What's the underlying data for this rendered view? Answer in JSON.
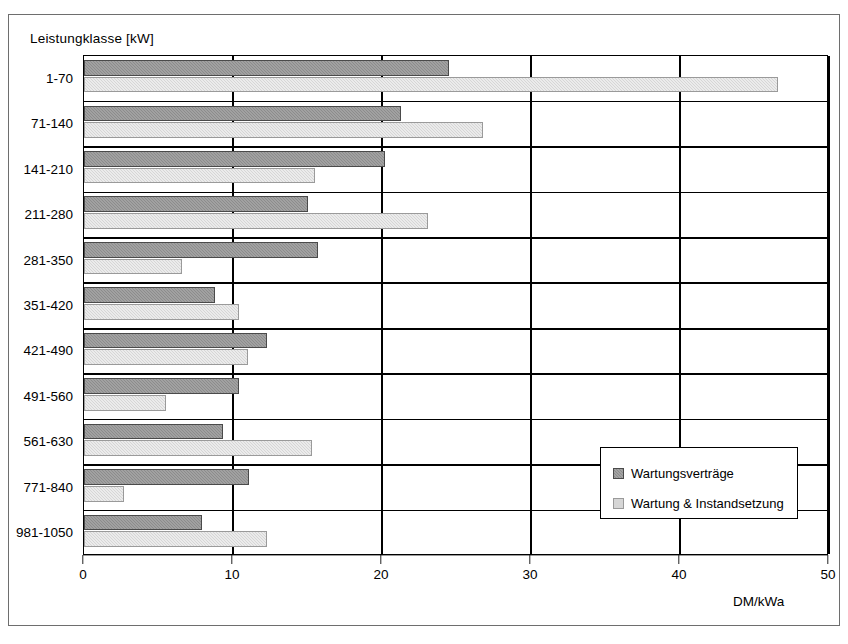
{
  "chart_data": {
    "type": "bar",
    "orientation": "horizontal",
    "title": "",
    "axis_caption": "Leistungklasse  [kW]",
    "xlabel": "DM/kWa",
    "ylabel": "Leistungklasse  [kW]",
    "xlim": [
      0,
      50
    ],
    "xticks": [
      0,
      10,
      20,
      30,
      40,
      50
    ],
    "xticklabels": [
      "0",
      "10",
      "20",
      "30",
      "40",
      "50"
    ],
    "grid": true,
    "legend_position": "lower right",
    "categories": [
      "1-70",
      "71-140",
      "141-210",
      "211-280",
      "281-350",
      "351-420",
      "421-490",
      "491-560",
      "561-630",
      "771-840",
      "981-1050"
    ],
    "series": [
      {
        "name": "Wartungsverträge",
        "color": "#8c8c8c",
        "values": [
          24.5,
          21.3,
          20.2,
          15.0,
          15.7,
          8.8,
          12.3,
          10.4,
          9.3,
          11.1,
          7.9
        ]
      },
      {
        "name": "Wartung & Instandsetzung",
        "color": "#d6d6d6",
        "values": [
          46.6,
          26.8,
          15.5,
          23.1,
          6.6,
          10.4,
          11.0,
          5.5,
          15.3,
          2.7,
          12.3
        ]
      }
    ]
  },
  "legend": {
    "items": [
      {
        "label": "Wartungsverträge",
        "swatch": "dark"
      },
      {
        "label": "Wartung & Instandsetzung",
        "swatch": "light"
      }
    ]
  }
}
